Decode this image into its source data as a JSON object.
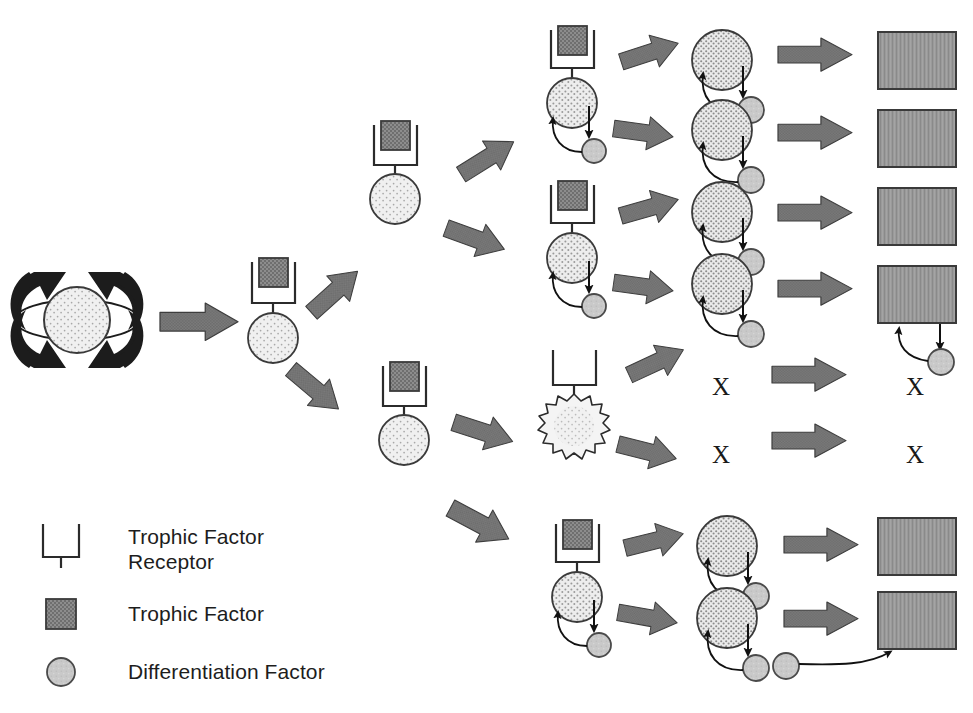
{
  "figure": {
    "background": "#ffffff"
  },
  "colors": {
    "trophic_factor_fill": "#8a8a8a",
    "trophic_factor_stroke": "#3a3a3a",
    "differentiation_factor_fill": "#c6c6c6",
    "differentiation_factor_stroke": "#4a4a4a",
    "cell_light_fill": "#ebebeb",
    "cell_stipple_fill": "#e2e2e2",
    "cell_dense_fill": "#dcdcdc",
    "terminal_cell_fill": "#949494",
    "terminal_cell_stroke": "#3a3a3a",
    "arrow_fill": "#787878",
    "arrow_stroke": "#3d3d3d",
    "renewal_arrow_fill": "#1c1c1c",
    "receptor_stroke": "#2b2b2b",
    "link_stroke": "#111111",
    "text": "#1d1d1d"
  },
  "legend": {
    "items": [
      {
        "key": "receptor",
        "icon": "receptor-icon",
        "label": "Trophic Factor\nReceptor"
      },
      {
        "key": "trophic_factor",
        "icon": "trophic-factor-square-icon",
        "label": "Trophic Factor"
      },
      {
        "key": "differentiation_factor",
        "icon": "differentiation-factor-circle-icon",
        "label": "Differentiation Factor"
      }
    ]
  },
  "stem_cell": {
    "name": "self-renewing-stem-cell",
    "label": "",
    "renewal_arrows": 4
  },
  "generations": [
    {
      "index": 1,
      "name": "stem-cell",
      "count": 1
    },
    {
      "index": 2,
      "name": "progenitor",
      "count": 3
    },
    {
      "index": 3,
      "name": "committed-progenitor",
      "count": 5
    },
    {
      "index": 4,
      "name": "differentiating-cell",
      "count": 6
    },
    {
      "index": 5,
      "name": "terminal-cell",
      "count": 6
    }
  ],
  "outcomes": {
    "surviving_terminal_cells": 6,
    "dead_cell_marker": "X",
    "dead_branches": 2,
    "apoptotic_cell_name": "dying-cell-burst"
  },
  "x_markers": [
    {
      "id": "x-col5-upper",
      "text": "X",
      "x": 712,
      "y": 374
    },
    {
      "id": "x-col5-lower",
      "text": "X",
      "x": 712,
      "y": 442
    },
    {
      "id": "x-col6-upper",
      "text": "X",
      "x": 906,
      "y": 374
    },
    {
      "id": "x-col6-lower",
      "text": "X",
      "x": 906,
      "y": 442
    }
  ],
  "legend_text_positions": [
    {
      "id": "legend-text-receptor",
      "x": 128,
      "y": 524
    },
    {
      "id": "legend-text-trophic-factor",
      "x": 128,
      "y": 601
    },
    {
      "id": "legend-text-differentiation-factor",
      "x": 128,
      "y": 659
    }
  ]
}
